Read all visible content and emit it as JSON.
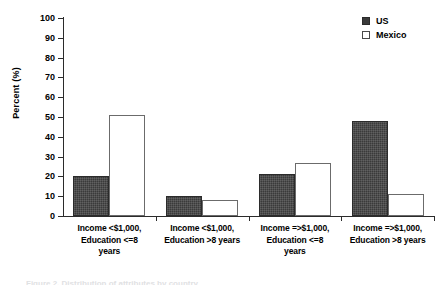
{
  "chart_data": {
    "type": "bar",
    "title": "",
    "xlabel": "",
    "ylabel": "Percent (%)",
    "ylim": [
      0,
      100
    ],
    "yticks": [
      0,
      10,
      20,
      30,
      40,
      50,
      60,
      70,
      80,
      90,
      100
    ],
    "grid": false,
    "legend_position": "top-right",
    "categories": [
      "Income <$1,000, Education <=8 years",
      "Income <$1,000, Education >8 years",
      "Income =>$1,000, Education <=8 years",
      "Income =>$1,000, Education >8 years"
    ],
    "category_lines": [
      [
        "Income <$1,000,",
        "Education <=8",
        "years"
      ],
      [
        "Income <$1,000,",
        "Education >8 years"
      ],
      [
        "Income =>$1,000,",
        "Education <=8",
        "years"
      ],
      [
        "Income =>$1,000,",
        "Education >8 years"
      ]
    ],
    "series": [
      {
        "name": "US",
        "color": "#3a3a3a",
        "values": [
          20,
          10,
          21,
          48
        ]
      },
      {
        "name": "Mexico",
        "color": "#ffffff",
        "values": [
          51,
          8,
          27,
          11
        ]
      }
    ]
  },
  "legend": {
    "items": [
      {
        "label": "US",
        "swatch": "filled-square-icon"
      },
      {
        "label": "Mexico",
        "swatch": "open-square-icon"
      }
    ]
  },
  "axis": {
    "y_label": "Percent (%)",
    "y_tick_labels": [
      "100",
      "90",
      "80",
      "70",
      "60",
      "50",
      "40",
      "30",
      "20",
      "10",
      "0"
    ]
  },
  "caption": {
    "sliver_text": "Figure 2. Distribution of attributes by country"
  }
}
